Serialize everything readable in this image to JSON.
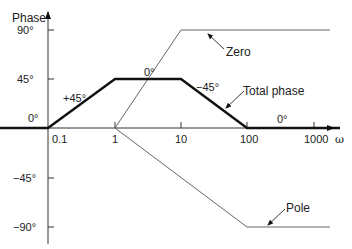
{
  "axes": {
    "y_label": "Phase",
    "x_label": "ω",
    "y_ticks": [
      "90°",
      "45°",
      "0°",
      "−45°",
      "−90°"
    ],
    "x_ticks": [
      "0.1",
      "1",
      "10",
      "100",
      "1000"
    ]
  },
  "annotations": {
    "slope_up": "+45°",
    "flat_top": "0°",
    "slope_down": "−45°",
    "flat_end": "0°",
    "zero": "Zero",
    "total_phase": "Total phase",
    "pole": "Pole"
  },
  "curves": {
    "zero": {
      "points_logw_deg": [
        [
          0,
          0
        ],
        [
          1,
          90
        ],
        [
          3.2,
          90
        ]
      ],
      "style": "thin"
    },
    "pole": {
      "points_logw_deg": [
        [
          0,
          0
        ],
        [
          2,
          -90
        ],
        [
          3.2,
          -90
        ]
      ],
      "style": "thin"
    },
    "total": {
      "points_logw_deg": [
        [
          -1.7,
          0
        ],
        [
          -1,
          0
        ],
        [
          0,
          45
        ],
        [
          1,
          45
        ],
        [
          2,
          0
        ],
        [
          3.4,
          0
        ]
      ],
      "style": "bold"
    }
  }
}
